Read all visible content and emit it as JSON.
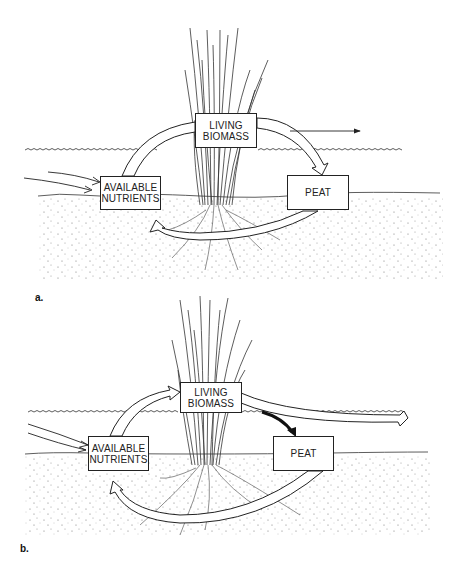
{
  "figure": {
    "panels": [
      {
        "id": "a",
        "label": "a.",
        "boxes": {
          "living_biomass": [
            "LIVING",
            "BIOMASS"
          ],
          "available_nutrients": [
            "AVAILABLE",
            "NUTRIENTS"
          ],
          "peat": [
            "PEAT"
          ]
        },
        "flows": [
          "external input -> available nutrients",
          "available nutrients -> living biomass (uptake)",
          "living biomass -> peat",
          "living biomass -> export (thin arrow)",
          "peat -> available nutrients (mineralization, below ground)"
        ]
      },
      {
        "id": "b",
        "label": "b.",
        "boxes": {
          "living_biomass": [
            "LIVING",
            "BIOMASS"
          ],
          "available_nutrients": [
            "AVAILABLE",
            "NUTRIENTS"
          ],
          "peat": [
            "PEAT"
          ]
        },
        "flows": [
          "external input -> available nutrients",
          "available nutrients -> living biomass (uptake)",
          "living biomass -> peat (thick black arrow)",
          "living biomass -> export (wide arrow)",
          "peat -> available nutrients (wide loop, below ground)"
        ]
      }
    ],
    "colors": {
      "line": "#222222",
      "background": "#ffffff",
      "stipple": "#777777"
    }
  }
}
